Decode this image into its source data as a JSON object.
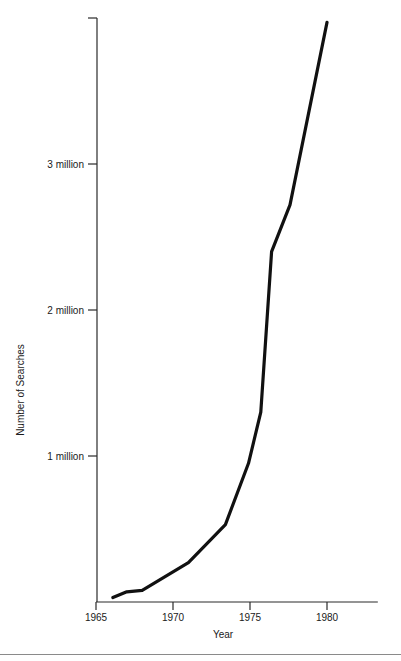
{
  "chart_data": {
    "type": "line",
    "title": "",
    "xlabel": "Year",
    "ylabel": "Number of Searches",
    "xlim": [
      1965,
      1983.3
    ],
    "ylim": [
      0,
      4000000
    ],
    "grid": false,
    "legend": null,
    "x_ticks": [
      {
        "value": 1965,
        "label": "1965"
      },
      {
        "value": 1970,
        "label": "1970"
      },
      {
        "value": 1975,
        "label": "1975"
      },
      {
        "value": 1980,
        "label": "1980"
      }
    ],
    "y_ticks": [
      {
        "value": 1000000,
        "label": "1 million"
      },
      {
        "value": 2000000,
        "label": "2 million"
      },
      {
        "value": 3000000,
        "label": "3 million"
      },
      {
        "value": 4000000,
        "label": ""
      }
    ],
    "series": [
      {
        "name": "Number of Searches",
        "color": "#111111",
        "x": [
          1966.1,
          1967.0,
          1968.0,
          1971.0,
          1973.4,
          1974.9,
          1975.7,
          1976.4,
          1977.6,
          1980.0
        ],
        "values": [
          30000,
          70000,
          80000,
          270000,
          530000,
          950000,
          1300000,
          2400000,
          2720000,
          3970000
        ]
      }
    ]
  }
}
